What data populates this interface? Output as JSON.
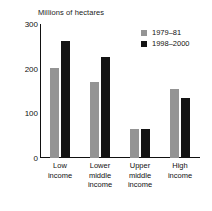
{
  "chart_data": {
    "type": "bar",
    "title": "Millions of hectares",
    "subtitle": "",
    "xlabel": "",
    "ylabel": "",
    "ylim": [
      0,
      300
    ],
    "ytick_values": [
      0,
      100,
      200,
      300
    ],
    "ytick_labels": [
      "0",
      "100",
      "200",
      "300"
    ],
    "grid": false,
    "legend_position": "top-right",
    "categories": [
      "Low income",
      "Lower middle income",
      "Upper middle income",
      "High income"
    ],
    "category_lines": [
      [
        "Low",
        "income"
      ],
      [
        "Lower",
        "middle",
        "income"
      ],
      [
        "Upper",
        "middle",
        "income"
      ],
      [
        "High",
        "income"
      ]
    ],
    "series": [
      {
        "name": "1979–81",
        "color": "#949494",
        "values": [
          202,
          170,
          65,
          155
        ]
      },
      {
        "name": "1998–2000",
        "color": "#141414",
        "values": [
          261,
          226,
          65,
          134
        ]
      }
    ]
  },
  "colors": {
    "series_1979_81": "#949494",
    "series_1998_2000": "#141414",
    "axis": "#111111",
    "background": "#ffffff"
  }
}
